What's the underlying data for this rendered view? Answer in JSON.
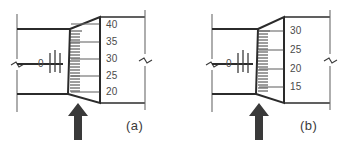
{
  "figure": {
    "title": "",
    "type": "micrometer-scale-diagram",
    "panel_count": 2
  },
  "panels": [
    {
      "id": "a",
      "caption": "(a)",
      "sleeve_index_label": "0",
      "drum_readings": [
        "40",
        "35",
        "30",
        "25",
        "20"
      ],
      "pointer": "up-arrow",
      "break_symbols": 2
    },
    {
      "id": "b",
      "caption": "(b)",
      "sleeve_index_label": "0",
      "drum_readings": [
        "30",
        "25",
        "20",
        "15"
      ],
      "pointer": "up-arrow",
      "break_symbols": 2
    }
  ],
  "colors": {
    "background": "#ffffff",
    "line": "#2b2b2b",
    "thin_line": "#6b6b6b",
    "tick": "#3c3c3c",
    "text": "#4a4a4a",
    "arrow": "#3a3a3a"
  }
}
